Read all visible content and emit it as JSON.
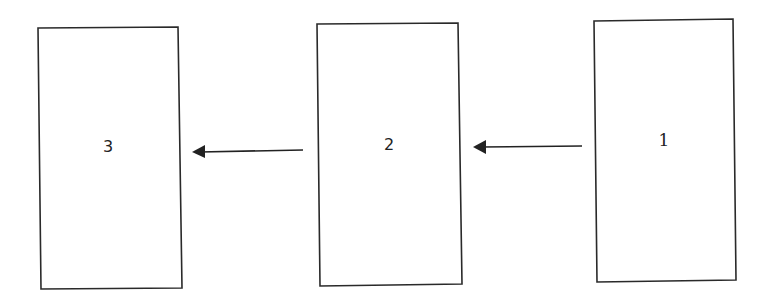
{
  "diagram": {
    "boxes": [
      {
        "id": "box-3",
        "label": "3"
      },
      {
        "id": "box-2",
        "label": "2"
      },
      {
        "id": "box-1",
        "label": "1"
      }
    ],
    "arrows": [
      {
        "from": "1",
        "to": "2"
      },
      {
        "from": "2",
        "to": "3"
      }
    ]
  }
}
